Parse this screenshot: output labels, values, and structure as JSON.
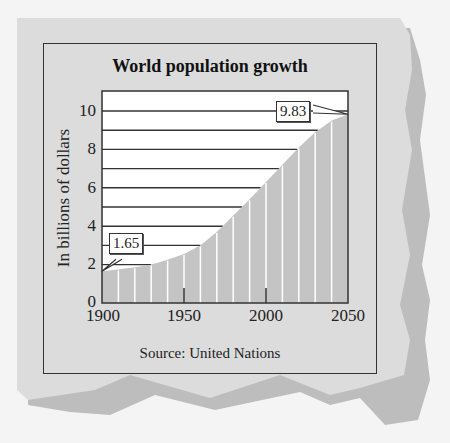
{
  "chart": {
    "title": "World population growth",
    "ylabel": "In billions of dollars",
    "source": "Source: United Nations",
    "y_ticks": [
      "0",
      "2",
      "4",
      "6",
      "8",
      "10"
    ],
    "x_ticks": [
      "1900",
      "1950",
      "2000",
      "2050"
    ],
    "callouts": {
      "start": "1.65",
      "end": "9.83"
    }
  },
  "colors": {
    "paper": "#dcdcdc",
    "paper_shadow": "#bdbdbd",
    "area_fill": "#c4c4c4",
    "plot_bg": "#ffffff",
    "gridline": "#333333",
    "stripe": "#ffffff"
  },
  "chart_data": {
    "type": "area",
    "title": "World population growth",
    "xlabel": "",
    "ylabel": "In billions of dollars",
    "source": "Source: United Nations",
    "x": [
      1900,
      1910,
      1920,
      1930,
      1940,
      1950,
      1960,
      1970,
      1980,
      1990,
      2000,
      2010,
      2020,
      2030,
      2040,
      2050
    ],
    "values": [
      1.65,
      1.75,
      1.86,
      2.0,
      2.25,
      2.55,
      3.0,
      3.7,
      4.55,
      5.4,
      6.3,
      7.2,
      8.1,
      8.9,
      9.5,
      9.83
    ],
    "annotations": [
      {
        "x": 1900,
        "y": 1.65,
        "label": "1.65"
      },
      {
        "x": 2050,
        "y": 9.83,
        "label": "9.83"
      }
    ],
    "xlim": [
      1900,
      2050
    ],
    "ylim": [
      0,
      11
    ],
    "x_ticks": [
      1900,
      1950,
      2000,
      2050
    ],
    "y_ticks": [
      0,
      2,
      4,
      6,
      8,
      10
    ],
    "grid": "horizontal lines at every 1 unit above the curve",
    "legend": null
  }
}
